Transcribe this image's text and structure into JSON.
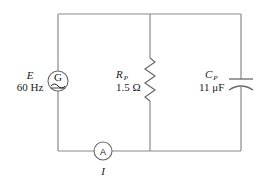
{
  "diagram": {
    "type": "parallel RC circuit with AC generator and ammeter",
    "colors": {
      "wire": "#8a8a8a",
      "component": "#6a6a6a",
      "text": "#1a1a1a",
      "background": "#ffffff"
    },
    "source": {
      "symbol_letter": "G",
      "name_label": "E",
      "value_label": "60 Hz"
    },
    "resistor": {
      "name_main": "R",
      "name_sub": "P",
      "value_label": "1.5 Ω"
    },
    "capacitor": {
      "name_main": "C",
      "name_sub": "P",
      "value_label": "11 μF"
    },
    "ammeter": {
      "symbol_letter": "A",
      "current_label": "I"
    }
  }
}
